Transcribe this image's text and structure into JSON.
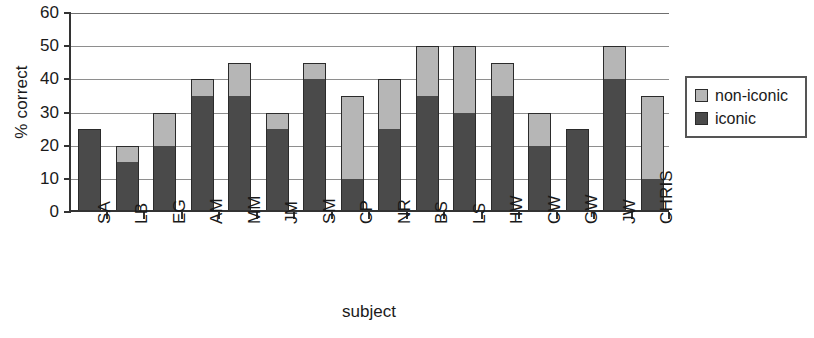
{
  "chart_data": {
    "type": "bar",
    "stacked": true,
    "title": "",
    "xlabel": "subject",
    "ylabel": "% correct",
    "ylim": [
      0,
      60
    ],
    "yticks": [
      0,
      10,
      20,
      30,
      40,
      50,
      60
    ],
    "grid": true,
    "legend_position": "right",
    "categories": [
      "SA",
      "LB",
      "EG",
      "AM",
      "MM",
      "JM",
      "SM",
      "CP",
      "NR",
      "BS",
      "LS",
      "HW",
      "CW",
      "GW",
      "JW",
      "CHRIS"
    ],
    "series": [
      {
        "name": "iconic",
        "color": "#4a4a4a",
        "values": [
          25,
          15,
          20,
          35,
          35,
          25,
          40,
          10,
          25,
          35,
          30,
          35,
          20,
          25,
          40,
          10
        ]
      },
      {
        "name": "non-iconic",
        "color": "#b6b6b6",
        "values": [
          0,
          5,
          10,
          5,
          10,
          5,
          5,
          25,
          15,
          15,
          20,
          10,
          10,
          0,
          10,
          25
        ]
      }
    ],
    "totals": [
      25,
      20,
      30,
      40,
      45,
      30,
      45,
      35,
      40,
      50,
      50,
      45,
      30,
      25,
      50,
      35
    ]
  },
  "legend": {
    "items": [
      {
        "label": "non-iconic",
        "swatch": "legend-swatch-non-iconic"
      },
      {
        "label": "iconic",
        "swatch": "legend-swatch-iconic"
      }
    ]
  },
  "axes": {
    "y_title": "% correct",
    "x_title": "subject",
    "y_tick_labels": [
      "60",
      "50",
      "40",
      "30",
      "20",
      "10",
      "0"
    ]
  }
}
